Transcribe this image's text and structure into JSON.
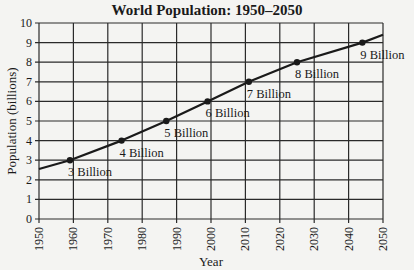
{
  "chart_data": {
    "type": "line",
    "title": "World Population: 1950–2050",
    "xlabel": "Year",
    "ylabel": "Population (billions)",
    "xlim": [
      1950,
      2050
    ],
    "ylim": [
      0,
      10
    ],
    "grid": true,
    "legend": null,
    "x_ticks": [
      "1950",
      "1960",
      "1970",
      "1980",
      "1990",
      "2000",
      "2010",
      "2020",
      "2030",
      "2040",
      "2050"
    ],
    "y_ticks": [
      "0",
      "1",
      "2",
      "3",
      "4",
      "5",
      "6",
      "7",
      "8",
      "9",
      "10"
    ],
    "series": [
      {
        "name": "World Population",
        "x": [
          1950,
          1959,
          1974,
          1987,
          1999,
          2011,
          2025,
          2044,
          2050
        ],
        "y": [
          2.55,
          3,
          4,
          5,
          6,
          7,
          8,
          9,
          9.4
        ]
      }
    ],
    "markers": [
      {
        "x": 1959,
        "y": 3,
        "label": "3 Billion"
      },
      {
        "x": 1974,
        "y": 4,
        "label": "4 Billion"
      },
      {
        "x": 1987,
        "y": 5,
        "label": "5 Billion"
      },
      {
        "x": 1999,
        "y": 6,
        "label": "6 Billion"
      },
      {
        "x": 2011,
        "y": 7,
        "label": "7 Billion"
      },
      {
        "x": 2025,
        "y": 8,
        "label": "8 Billion"
      },
      {
        "x": 2044,
        "y": 9,
        "label": "9 Billion"
      }
    ]
  },
  "colors": {
    "line": "#1a1a1a",
    "grid": "#2a2a2a",
    "background": "#f4f4f2"
  }
}
